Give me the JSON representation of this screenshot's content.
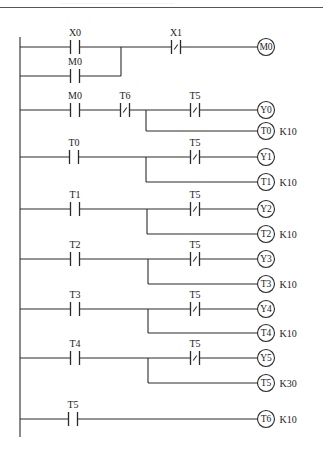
{
  "header": {
    "cut_text": "…………………………………………………"
  },
  "rail": {
    "x": 20,
    "y1": 37,
    "y2": 437
  },
  "coil_x": 266,
  "rungs": [
    {
      "id": "rung-1",
      "y": 47,
      "contacts": [
        {
          "label": "X0",
          "type": "NO",
          "x": 75
        },
        {
          "label": "X1",
          "type": "NC",
          "x": 176
        }
      ],
      "parallel": {
        "label": "M0",
        "type": "NO",
        "x": 75,
        "y": 76,
        "join_x": 121
      },
      "coils": [
        {
          "label": "M0",
          "y": 47,
          "preset": ""
        }
      ]
    },
    {
      "id": "rung-2",
      "y": 110,
      "contacts": [
        {
          "label": "M0",
          "type": "NO",
          "x": 75
        },
        {
          "label": "T6",
          "type": "NC",
          "x": 125
        },
        {
          "label": "T5",
          "type": "NC",
          "x": 195
        }
      ],
      "branch_x": 146,
      "coils": [
        {
          "label": "Y0",
          "y": 110,
          "preset": ""
        },
        {
          "label": "T0",
          "y": 131,
          "preset": "K10"
        }
      ]
    },
    {
      "id": "rung-3",
      "y": 157,
      "contacts": [
        {
          "label": "T0",
          "type": "NO",
          "x": 74
        },
        {
          "label": "T5",
          "type": "NC",
          "x": 195
        }
      ],
      "branch_x": 146,
      "coils": [
        {
          "label": "Y1",
          "y": 157,
          "preset": ""
        },
        {
          "label": "T1",
          "y": 182,
          "preset": "K10"
        }
      ]
    },
    {
      "id": "rung-4",
      "y": 209,
      "contacts": [
        {
          "label": "T1",
          "type": "NO",
          "x": 75
        },
        {
          "label": "T5",
          "type": "NC",
          "x": 195
        }
      ],
      "branch_x": 147,
      "coils": [
        {
          "label": "Y2",
          "y": 209,
          "preset": ""
        },
        {
          "label": "T2",
          "y": 234,
          "preset": "K10"
        }
      ]
    },
    {
      "id": "rung-5",
      "y": 259,
      "contacts": [
        {
          "label": "T2",
          "type": "NO",
          "x": 75
        },
        {
          "label": "T5",
          "type": "NC",
          "x": 195
        }
      ],
      "branch_x": 148,
      "coils": [
        {
          "label": "Y3",
          "y": 259,
          "preset": ""
        },
        {
          "label": "T3",
          "y": 284,
          "preset": "K10"
        }
      ]
    },
    {
      "id": "rung-6",
      "y": 309,
      "contacts": [
        {
          "label": "T3",
          "type": "NO",
          "x": 75
        },
        {
          "label": "T5",
          "type": "NC",
          "x": 195
        }
      ],
      "branch_x": 148,
      "coils": [
        {
          "label": "Y4",
          "y": 309,
          "preset": ""
        },
        {
          "label": "T4",
          "y": 333,
          "preset": "K10"
        }
      ]
    },
    {
      "id": "rung-7",
      "y": 358,
      "contacts": [
        {
          "label": "T4",
          "type": "NO",
          "x": 75
        },
        {
          "label": "T5",
          "type": "NC",
          "x": 195
        }
      ],
      "branch_x": 148,
      "coils": [
        {
          "label": "Y5",
          "y": 358,
          "preset": ""
        },
        {
          "label": "T5",
          "y": 383,
          "preset": "K30"
        }
      ]
    },
    {
      "id": "rung-8",
      "y": 419,
      "contacts": [
        {
          "label": "T5",
          "type": "NO",
          "x": 73
        }
      ],
      "coils": [
        {
          "label": "T6",
          "y": 419,
          "preset": "K10"
        }
      ]
    }
  ]
}
